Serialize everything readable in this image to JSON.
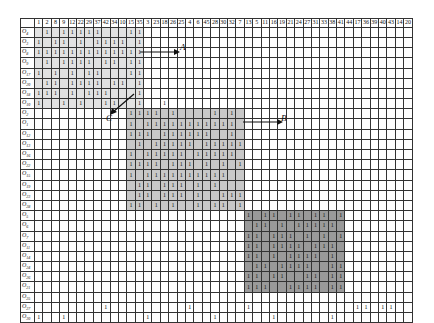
{
  "columns": [
    "1",
    "2",
    "8",
    "9",
    "12",
    "22",
    "29",
    "37",
    "42",
    "34",
    "10",
    "15",
    "35",
    "3",
    "23",
    "18",
    "26",
    "25",
    "4",
    "6",
    "45",
    "28",
    "30",
    "32",
    "7",
    "13",
    "5",
    "11",
    "16",
    "19",
    "21",
    "24",
    "27",
    "31",
    "33",
    "38",
    "41",
    "44",
    "17",
    "36",
    "39",
    "40",
    "43",
    "14",
    "20"
  ],
  "rows": [
    {
      "label": "O4",
      "ones": [
        1,
        3,
        4,
        5,
        6,
        7,
        11,
        12
      ]
    },
    {
      "label": "O3",
      "ones": [
        0,
        2,
        3,
        5,
        7,
        8,
        9,
        10,
        12
      ]
    },
    {
      "label": "O8",
      "ones": [
        0,
        1,
        2,
        3,
        4,
        5,
        6,
        7,
        8,
        9,
        10,
        11,
        12
      ]
    },
    {
      "label": "O9",
      "ones": [
        1,
        3,
        4,
        5,
        6,
        8,
        9,
        11,
        12
      ]
    },
    {
      "label": "O17",
      "ones": [
        0,
        2,
        4,
        6,
        7,
        11,
        12
      ]
    },
    {
      "label": "O20",
      "ones": [
        1,
        2,
        4,
        5,
        6,
        7,
        9,
        10,
        12
      ]
    },
    {
      "label": "O18",
      "ones": [
        0,
        1,
        2,
        4,
        6,
        7,
        8,
        12
      ]
    },
    {
      "label": "O10",
      "ones": [
        0,
        3,
        5,
        8,
        9,
        12,
        15
      ]
    },
    {
      "label": "O2",
      "ones": [
        11,
        12,
        13,
        14,
        16,
        21,
        23
      ]
    },
    {
      "label": "O1",
      "ones": [
        11,
        13,
        14,
        15,
        16,
        17,
        18,
        19,
        20,
        21,
        22,
        23
      ]
    },
    {
      "label": "O12",
      "ones": [
        11,
        12,
        13,
        15,
        16,
        17,
        18,
        19,
        20,
        23
      ]
    },
    {
      "label": "O13",
      "ones": [
        12,
        14,
        15,
        16,
        17,
        18,
        20,
        21,
        22,
        23,
        24
      ]
    },
    {
      "label": "O16",
      "ones": [
        11,
        13,
        14,
        15,
        16,
        17,
        19,
        20,
        21,
        22,
        23
      ]
    },
    {
      "label": "O22",
      "ones": [
        11,
        12,
        13,
        14,
        16,
        17,
        18,
        20,
        22,
        24
      ]
    },
    {
      "label": "O15",
      "ones": [
        11,
        13,
        14,
        15,
        16,
        17,
        18,
        19,
        20,
        21,
        22
      ]
    },
    {
      "label": "O19",
      "ones": [
        12,
        13,
        15,
        16,
        17,
        19,
        21
      ]
    },
    {
      "label": "O23",
      "ones": [
        12,
        13,
        15,
        16,
        17,
        19,
        22,
        23,
        24
      ]
    },
    {
      "label": "O28",
      "ones": [
        11,
        12,
        14,
        16,
        19,
        21,
        22,
        24
      ]
    },
    {
      "label": "O5",
      "ones": [
        25,
        27,
        28,
        30,
        31,
        33,
        34,
        36
      ]
    },
    {
      "label": "O6",
      "ones": [
        26,
        27,
        29,
        31,
        32,
        33,
        34,
        35
      ]
    },
    {
      "label": "O7",
      "ones": [
        25,
        26,
        28,
        29,
        30,
        32,
        34,
        36
      ]
    },
    {
      "label": "O11",
      "ones": [
        25,
        26,
        28,
        29,
        30,
        31,
        33,
        34,
        35
      ]
    },
    {
      "label": "O14",
      "ones": [
        25,
        26,
        28,
        30,
        31,
        32,
        33,
        35
      ]
    },
    {
      "label": "O24",
      "ones": [
        26,
        27,
        29,
        30,
        31,
        32,
        35,
        36
      ]
    },
    {
      "label": "O26",
      "ones": [
        25,
        26,
        28,
        29,
        32,
        33,
        35,
        36
      ]
    },
    {
      "label": "O21",
      "ones": [
        25,
        26,
        27,
        30,
        31,
        32,
        33,
        35,
        36
      ]
    },
    {
      "label": "O25",
      "ones": []
    },
    {
      "label": "O27",
      "ones": [
        8,
        18,
        25,
        38,
        39,
        41,
        42
      ]
    },
    {
      "label": "O30",
      "ones": [
        0,
        3,
        13,
        21,
        28,
        35
      ]
    }
  ],
  "blocks": [
    {
      "name": "A",
      "rows": [
        0,
        7
      ],
      "cols": [
        0,
        12
      ],
      "shade": "g1"
    },
    {
      "name": "C",
      "rows": [
        8,
        17
      ],
      "cols": [
        11,
        24
      ],
      "shade": "g2"
    },
    {
      "name": "B",
      "rows": [
        18,
        25
      ],
      "cols": [
        25,
        36
      ],
      "shade": "g3"
    }
  ],
  "annotations": {
    "a": "A",
    "b": "B",
    "c": "C"
  }
}
